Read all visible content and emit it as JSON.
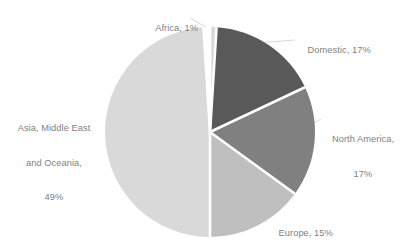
{
  "chart_data": {
    "type": "pie",
    "title": "",
    "subtitle": "",
    "xlabel": "",
    "ylabel": "",
    "legend_position": "none",
    "grid": false,
    "labels_shown": "category, percent",
    "total_percent": 99,
    "start_angle_deg": 0,
    "direction": "clockwise",
    "categories": [
      "Africa",
      "Domestic",
      "North America",
      "Europe",
      "Asia, Middle East and Oceania"
    ],
    "values": [
      1,
      17,
      17,
      15,
      49
    ],
    "units": "%",
    "colors": [
      "#d9d9d9",
      "#595959",
      "#808080",
      "#bfbfbf",
      "#d9d9d9"
    ],
    "slices": [
      {
        "name": "Africa",
        "value": 1,
        "color": "#d9d9d9",
        "label_lines": [
          "Africa, 1%"
        ],
        "label_position": "top-left-outside"
      },
      {
        "name": "Domestic",
        "value": 17,
        "color": "#595959",
        "label_lines": [
          "Domestic, 17%"
        ],
        "label_position": "top-right-outside"
      },
      {
        "name": "North America",
        "value": 17,
        "color": "#808080",
        "label_lines": [
          "North America,",
          "17%"
        ],
        "label_position": "right-outside"
      },
      {
        "name": "Europe",
        "value": 15,
        "color": "#bfbfbf",
        "label_lines": [
          "Europe, 15%"
        ],
        "label_position": "bottom-right-outside"
      },
      {
        "name": "Asia, Middle East and Oceania",
        "value": 49,
        "color": "#d9d9d9",
        "label_lines": [
          "Asia, Middle East",
          "and Oceania,",
          "49%"
        ],
        "label_position": "left-outside"
      }
    ]
  },
  "labels": {
    "africa": "Africa, 1%",
    "domestic": "Domestic, 17%",
    "north_america_line1": "North America,",
    "north_america_line2": "17%",
    "europe": "Europe, 15%",
    "asia_line1": "Asia, Middle East",
    "asia_line2": "and Oceania,",
    "asia_line3": "49%"
  },
  "style": {
    "background": "#ffffff",
    "label_color": "#7f7f7f",
    "leader_line_color": "#d0d0d0",
    "slice_separator_color": "#ffffff"
  }
}
